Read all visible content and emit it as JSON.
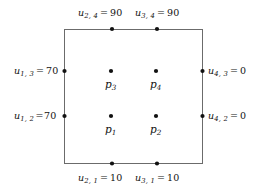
{
  "figure": {
    "type": "diagram",
    "background_color": "#ffffff",
    "line_color": "#6b6b6b",
    "node_color": "#111111",
    "text_color": "#111111"
  },
  "domain_rect": {
    "x": 64,
    "y": 29,
    "width": 139,
    "height": 135
  },
  "boundary_labels": {
    "top": [
      {
        "id": "u-2-4",
        "symbol": "u",
        "subscript": "2, 4",
        "equals": "=",
        "value": "90",
        "text": "u2, 4 = 90",
        "node": {
          "x": 112,
          "y": 29
        },
        "label_pos": {
          "x": 78,
          "y": 8
        }
      },
      {
        "id": "u-3-4",
        "symbol": "u",
        "subscript": "3, 4",
        "equals": "=",
        "value": "90",
        "text": "u3, 4 = 90",
        "node": {
          "x": 157,
          "y": 29
        },
        "label_pos": {
          "x": 135,
          "y": 8
        }
      }
    ],
    "left": [
      {
        "id": "u-1-3",
        "symbol": "u",
        "subscript": "1, 3",
        "equals": "=",
        "value": "70",
        "text": "u1, 3 = 70",
        "node": {
          "x": 64,
          "y": 71
        },
        "label_pos": {
          "x": 14,
          "y": 66
        },
        "tight": false
      },
      {
        "id": "u-1-2",
        "symbol": "u",
        "subscript": "1, 2",
        "equals": "=",
        "value": "70",
        "text": "u1, 2 =70",
        "node": {
          "x": 64,
          "y": 116
        },
        "label_pos": {
          "x": 14,
          "y": 111
        },
        "tight": true
      }
    ],
    "right": [
      {
        "id": "u-4-3",
        "symbol": "u",
        "subscript": "4, 3",
        "equals": "=",
        "value": "0",
        "text": "u4, 3 = 0",
        "node": {
          "x": 203,
          "y": 71
        },
        "label_pos": {
          "x": 208,
          "y": 66
        },
        "tight": false
      },
      {
        "id": "u-4-2",
        "symbol": "u",
        "subscript": "4, 2",
        "equals": "=",
        "value": "0",
        "text": "u4, 2 = 0",
        "node": {
          "x": 203,
          "y": 116
        },
        "label_pos": {
          "x": 208,
          "y": 111
        },
        "tight": false
      }
    ],
    "bottom": [
      {
        "id": "u-2-1",
        "symbol": "u",
        "subscript": "2, 1",
        "equals": "=",
        "value": "10",
        "text": "u2, 1 = 10",
        "node": {
          "x": 112,
          "y": 164
        },
        "label_pos": {
          "x": 78,
          "y": 173
        }
      },
      {
        "id": "u-3-1",
        "symbol": "u",
        "subscript": "3, 1",
        "equals": "=",
        "value": "10",
        "text": "u3, 1 = 10",
        "node": {
          "x": 157,
          "y": 164
        },
        "label_pos": {
          "x": 135,
          "y": 173
        }
      }
    ]
  },
  "interior_points": [
    {
      "id": "p1",
      "symbol": "p",
      "subscript": "1",
      "text": "p1",
      "node": {
        "x": 111,
        "y": 116
      },
      "label_pos": {
        "x": 105,
        "y": 124
      }
    },
    {
      "id": "p2",
      "symbol": "p",
      "subscript": "2",
      "text": "p2",
      "node": {
        "x": 156,
        "y": 116
      },
      "label_pos": {
        "x": 150,
        "y": 124
      }
    },
    {
      "id": "p3",
      "symbol": "p",
      "subscript": "3",
      "text": "p3",
      "node": {
        "x": 111,
        "y": 71
      },
      "label_pos": {
        "x": 105,
        "y": 79
      }
    },
    {
      "id": "p4",
      "symbol": "p",
      "subscript": "4",
      "text": "p4",
      "node": {
        "x": 156,
        "y": 71
      },
      "label_pos": {
        "x": 150,
        "y": 79
      }
    }
  ]
}
